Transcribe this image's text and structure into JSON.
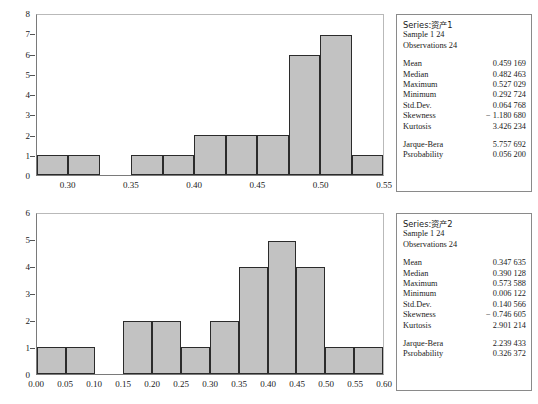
{
  "panels": [
    {
      "id": "panel-1",
      "chart_data": {
        "type": "bar",
        "title": "",
        "xlabel": "",
        "ylabel": "",
        "ylim": [
          0,
          8
        ],
        "xlim": [
          0.275,
          0.55
        ],
        "bin_width": 0.025,
        "grid": false,
        "legend": "none",
        "y_ticks": [
          "0",
          "1",
          "2",
          "3",
          "4",
          "5",
          "6",
          "7",
          "8"
        ],
        "y_tick_values": [
          0,
          1,
          2,
          3,
          4,
          5,
          6,
          7,
          8
        ],
        "x_ticks": [
          "0.30",
          "0.35",
          "0.40",
          "0.45",
          "0.50",
          "0.55"
        ],
        "x_tick_values": [
          0.3,
          0.35,
          0.4,
          0.45,
          0.5,
          0.55
        ],
        "bin_edges": [
          0.275,
          0.3,
          0.325,
          0.35,
          0.375,
          0.4,
          0.425,
          0.45,
          0.475,
          0.5,
          0.525,
          0.55
        ],
        "categories": [
          "0.275-0.300",
          "0.300-0.325",
          "0.325-0.350",
          "0.350-0.375",
          "0.375-0.400",
          "0.400-0.425",
          "0.425-0.450",
          "0.450-0.475",
          "0.475-0.500",
          "0.500-0.525",
          "0.525-0.550"
        ],
        "values": [
          1,
          1,
          0,
          1,
          1,
          2,
          2,
          2,
          6,
          7,
          1
        ],
        "bar_fill": "#c2c2c2",
        "bar_edge": "#2b2b2b"
      },
      "stats": {
        "series_label": "Series:资产1",
        "sample_label": "Sample 1 24",
        "observations_label": "Observations 24",
        "rows": [
          {
            "key": "Mean",
            "value": "0.459 169"
          },
          {
            "key": "Median",
            "value": "0.482 463"
          },
          {
            "key": "Maximum",
            "value": "0.527 029"
          },
          {
            "key": "Minimum",
            "value": "0.292 724"
          },
          {
            "key": "Std.Dev.",
            "value": "0.064 768"
          },
          {
            "key": "Skewness",
            "value": "− 1.180 680"
          },
          {
            "key": "Kurtosis",
            "value": "3.426 234"
          }
        ],
        "rows2": [
          {
            "key": "Jarque-Bera",
            "value": "5.757 692"
          },
          {
            "key": "Psrobability",
            "value": "0.056 200"
          }
        ]
      }
    },
    {
      "id": "panel-2",
      "chart_data": {
        "type": "bar",
        "title": "",
        "xlabel": "",
        "ylabel": "",
        "ylim": [
          0,
          6
        ],
        "xlim": [
          0.0,
          0.6
        ],
        "bin_width": 0.05,
        "grid": false,
        "legend": "none",
        "y_ticks": [
          "0",
          "1",
          "2",
          "3",
          "4",
          "5",
          "6"
        ],
        "y_tick_values": [
          0,
          1,
          2,
          3,
          4,
          5,
          6
        ],
        "x_ticks": [
          "0.00",
          "0.05",
          "0.10",
          "0.15",
          "0.20",
          "0.25",
          "0.30",
          "0.35",
          "0.40",
          "0.45",
          "0.50",
          "0.55",
          "0.60"
        ],
        "x_tick_values": [
          0.0,
          0.05,
          0.1,
          0.15,
          0.2,
          0.25,
          0.3,
          0.35,
          0.4,
          0.45,
          0.5,
          0.55,
          0.6
        ],
        "bin_edges": [
          0.0,
          0.05,
          0.1,
          0.15,
          0.2,
          0.25,
          0.3,
          0.35,
          0.4,
          0.45,
          0.5,
          0.55,
          0.6
        ],
        "categories": [
          "0.00-0.05",
          "0.05-0.10",
          "0.10-0.15",
          "0.15-0.20",
          "0.20-0.25",
          "0.25-0.30",
          "0.30-0.35",
          "0.35-0.40",
          "0.40-0.45",
          "0.45-0.50",
          "0.50-0.55",
          "0.55-0.60"
        ],
        "values": [
          1,
          1,
          0,
          2,
          2,
          1,
          2,
          4,
          5,
          4,
          1,
          1
        ],
        "bar_fill": "#c2c2c2",
        "bar_edge": "#2b2b2b"
      },
      "stats": {
        "series_label": "Series:资产2",
        "sample_label": "Sample 1 24",
        "observations_label": "Observations 24",
        "rows": [
          {
            "key": "Mean",
            "value": "0.347 635"
          },
          {
            "key": "Median",
            "value": "0.390 128"
          },
          {
            "key": "Maximum",
            "value": "0.573 588"
          },
          {
            "key": "Minimum",
            "value": "0.006 122"
          },
          {
            "key": "Std.Dev.",
            "value": "0.140 566"
          },
          {
            "key": "Skewness",
            "value": "− 0.746 605"
          },
          {
            "key": "Kurtosis",
            "value": "2.901 214"
          }
        ],
        "rows2": [
          {
            "key": "Jarque-Bera",
            "value": "2.239 433"
          },
          {
            "key": "Psrobability",
            "value": "0.326 372"
          }
        ]
      }
    }
  ]
}
